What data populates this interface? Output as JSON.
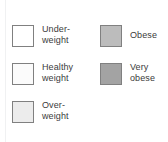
{
  "chart_data": {
    "type": "table",
    "title": "",
    "subtitle": "",
    "xlabel": "",
    "ylabel": "",
    "legend_position": "standalone-two-column",
    "grid": false,
    "categories": [
      "Underweight",
      "Healthy weight",
      "Overweight",
      "Obese",
      "Very obese"
    ],
    "series": [
      {
        "name": "BMI category swatches",
        "values": [
          "#ffffff",
          "#fbfbfb",
          "#ececec",
          "#bcbcbc",
          "#a3a3a3"
        ]
      }
    ]
  },
  "legend": {
    "columns": [
      {
        "name": "left-column",
        "items": [
          {
            "label": "Under-\nweight",
            "plain_label": "Underweight",
            "swatch_color": "#ffffff",
            "swatch_border": "#808080",
            "lines": 2
          },
          {
            "label": "Healthy\nweight",
            "plain_label": "Healthy weight",
            "swatch_color": "#fbfbfb",
            "swatch_border": "#808080",
            "lines": 2
          },
          {
            "label": "Over-\nweight",
            "plain_label": "Overweight",
            "swatch_color": "#ececec",
            "swatch_border": "#808080",
            "lines": 2
          }
        ]
      },
      {
        "name": "right-column",
        "items": [
          {
            "label": "Obese",
            "plain_label": "Obese",
            "swatch_color": "#bcbcbc",
            "swatch_border": "#808080",
            "lines": 1
          },
          {
            "label": "Very\nobese",
            "plain_label": "Very obese",
            "swatch_color": "#a3a3a3",
            "swatch_border": "#808080",
            "lines": 2
          }
        ]
      }
    ]
  },
  "colors": {
    "background": "#ffffff",
    "text": "#3b3b3b",
    "swatch_border": "#808080",
    "rule": "#f0f1f2"
  }
}
